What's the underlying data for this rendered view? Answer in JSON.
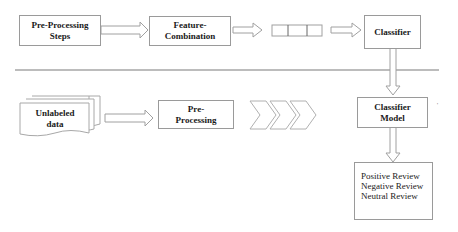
{
  "training": {
    "preprocessing_steps": {
      "line1": "Pre-Processing",
      "line2": "Steps"
    },
    "feature_combination": {
      "line1": "Feature-",
      "line2": "Combination"
    },
    "feature_vector": {
      "cells": 3
    },
    "classifier": {
      "label": "Classifier"
    }
  },
  "testing": {
    "unlabeled_data": {
      "line1": "Unlabeled",
      "line2": "data"
    },
    "preprocessing": {
      "line1": "Pre-",
      "line2": "Processing"
    },
    "classifier_model": {
      "line1": "Classifier",
      "line2": "Model"
    },
    "results": [
      "Positive Review",
      "Negative Review",
      "Neutral Review"
    ]
  },
  "colors": {
    "stroke": "#9a9a9a",
    "divider": "#7a7a7a",
    "text": "#1a1a1a"
  },
  "stray_mark": "'"
}
